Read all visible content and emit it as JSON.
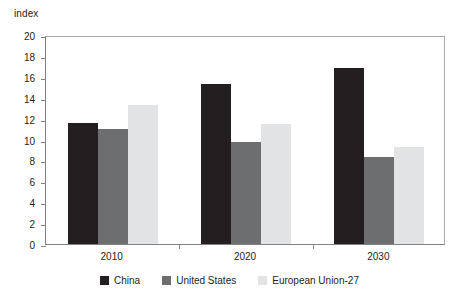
{
  "chart_data": {
    "type": "bar",
    "title": "",
    "xlabel": "",
    "ylabel": "index",
    "ylim": [
      0,
      20
    ],
    "ytick_step": 2,
    "yticks": [
      20,
      18,
      16,
      14,
      12,
      10,
      8,
      6,
      4,
      2,
      0
    ],
    "grid": false,
    "legend_position": "bottom",
    "categories": [
      "2010",
      "2020",
      "2030"
    ],
    "series": [
      {
        "name": "China",
        "color": "#231f20",
        "values": [
          11.6,
          15.3,
          16.8
        ]
      },
      {
        "name": "United States",
        "color": "#6d6e70",
        "values": [
          11.0,
          9.8,
          8.3
        ]
      },
      {
        "name": "European Union-27",
        "color": "#e2e3e4",
        "values": [
          13.3,
          11.5,
          9.3
        ]
      }
    ]
  },
  "axis": {
    "unit_label": "index"
  },
  "legend": {
    "items": [
      {
        "label": "China",
        "key": "china"
      },
      {
        "label": "United States",
        "key": "us"
      },
      {
        "label": "European Union-27",
        "key": "eu"
      }
    ]
  }
}
